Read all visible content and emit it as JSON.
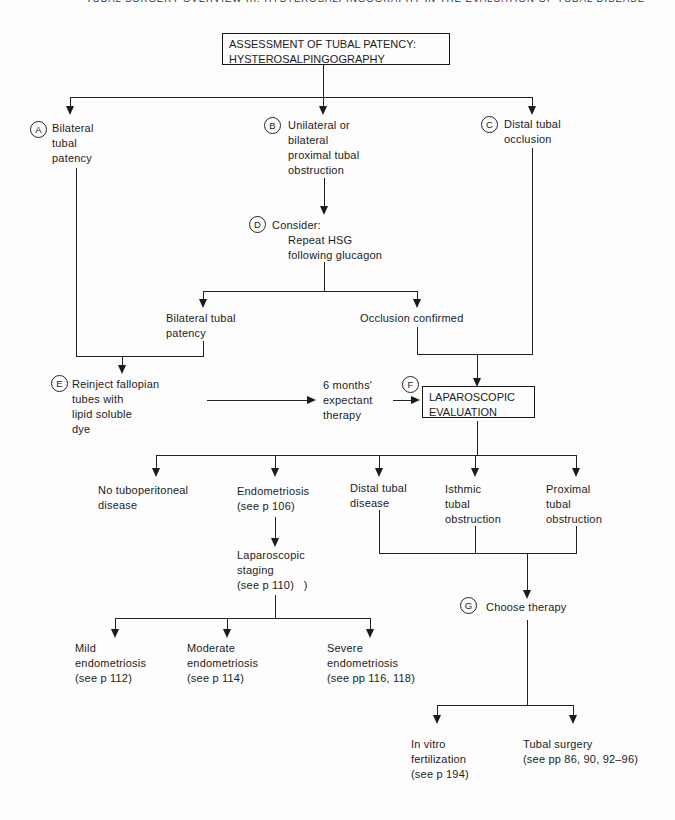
{
  "running_head": "TUBAL SURGERY OVERVIEW III: HYSTEROSALPINGOGRAPHY IN THE EVALUATION OF TUBAL DISEASE",
  "title_box": {
    "lines": [
      "ASSESSMENT OF TUBAL PATENCY:",
      "HYSTEROSALPINGOGRAPHY"
    ]
  },
  "steps": {
    "a": {
      "letter": "A",
      "lines": [
        "Bilateral",
        "tubal",
        "patency"
      ]
    },
    "b": {
      "letter": "B",
      "lines": [
        "Unilateral or",
        "bilateral",
        "proximal tubal",
        "obstruction"
      ]
    },
    "c": {
      "letter": "C",
      "lines": [
        "Distal tubal",
        "occlusion"
      ]
    },
    "d": {
      "letter": "D",
      "title": "Consider:",
      "lines": [
        "Repeat HSG",
        "following glucagon"
      ]
    },
    "e": {
      "letter": "E",
      "lines": [
        "Reinject fallopian",
        "tubes with",
        "lipid soluble",
        "dye"
      ]
    },
    "f": {
      "letter": "F",
      "lines": [
        "LAPAROSCOPIC",
        "EVALUATION"
      ]
    },
    "g": {
      "letter": "G",
      "label": "Choose therapy"
    }
  },
  "labels": {
    "bilateral_patency": [
      "Bilateral tubal",
      "patency"
    ],
    "occlusion_confirmed": [
      "Occlusion confirmed"
    ],
    "expectant": [
      "6 months'",
      "expectant",
      "therapy"
    ],
    "no_tuboperitoneal": [
      "No tuboperitoneal",
      "disease"
    ],
    "endometriosis": [
      "Endometriosis",
      "(see p 106)"
    ],
    "distal_tubal": [
      "Distal tubal",
      "disease"
    ],
    "isthmic": [
      "Isthmic",
      "tubal",
      "obstruction"
    ],
    "proximal": [
      "Proximal",
      "tubal",
      "obstruction"
    ],
    "staging": [
      "Laparoscopic",
      "staging",
      "(see p 110)   )"
    ],
    "mild": [
      "Mild",
      "endometriosis",
      "(see p 112)"
    ],
    "moderate": [
      "Moderate",
      "endometriosis",
      "(see p 114)"
    ],
    "severe": [
      "Severe",
      "endometriosis",
      "(see pp 116, 118)"
    ],
    "ivf": [
      "In vitro",
      "fertilization",
      "(see p 194)"
    ],
    "tubal_surgery": [
      "Tubal surgery",
      "(see pp 86, 90, 92–96)"
    ]
  }
}
